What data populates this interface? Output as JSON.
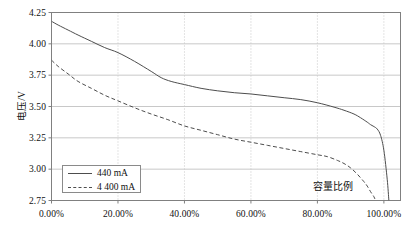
{
  "chart_data": {
    "type": "line",
    "title": "",
    "xlabel": "容量比例",
    "ylabel": "电压/V",
    "xlim": [
      0,
      105
    ],
    "ylim": [
      2.75,
      4.25
    ],
    "grid": true,
    "legend_position": "bottom-left",
    "x_tick_labels": [
      "0.00%",
      "20.00%",
      "40.00%",
      "60.00%",
      "80.00%",
      "100.00%"
    ],
    "x_tick_values": [
      0,
      20,
      40,
      60,
      80,
      100
    ],
    "y_tick_labels": [
      "2.75",
      "3.00",
      "3.25",
      "3.50",
      "3.75",
      "4.00",
      "4.25"
    ],
    "y_tick_values": [
      2.75,
      3.0,
      3.25,
      3.5,
      3.75,
      4.0,
      4.25
    ],
    "series": [
      {
        "name": "440 mA",
        "style": "solid",
        "color": "#4d4d4d",
        "x": [
          0,
          2,
          5,
          8,
          12,
          16,
          20,
          25,
          30,
          33,
          36,
          40,
          45,
          50,
          55,
          60,
          65,
          70,
          75,
          80,
          85,
          88,
          91,
          93,
          95,
          96,
          97,
          98,
          99,
          100,
          101,
          101.5
        ],
        "y": [
          4.18,
          4.15,
          4.11,
          4.07,
          4.02,
          3.97,
          3.93,
          3.86,
          3.78,
          3.73,
          3.7,
          3.675,
          3.645,
          3.625,
          3.61,
          3.6,
          3.585,
          3.57,
          3.555,
          3.53,
          3.495,
          3.47,
          3.44,
          3.41,
          3.375,
          3.355,
          3.34,
          3.32,
          3.27,
          3.15,
          2.92,
          2.75
        ]
      },
      {
        "name": "4 400 mA",
        "style": "dashed",
        "color": "#4d4d4d",
        "x": [
          0,
          2,
          5,
          8,
          12,
          16,
          20,
          25,
          30,
          35,
          40,
          45,
          50,
          55,
          60,
          65,
          70,
          75,
          80,
          83,
          86,
          88,
          90,
          92,
          94,
          95,
          96,
          97,
          97.5
        ],
        "y": [
          3.87,
          3.82,
          3.76,
          3.7,
          3.645,
          3.59,
          3.545,
          3.49,
          3.44,
          3.395,
          3.345,
          3.31,
          3.275,
          3.24,
          3.215,
          3.19,
          3.165,
          3.14,
          3.115,
          3.1,
          3.07,
          3.045,
          3.01,
          2.96,
          2.9,
          2.865,
          2.82,
          2.78,
          2.75
        ]
      }
    ],
    "colors": {
      "axis": "#808080",
      "grid": "#c8c8c8",
      "line": "#4d4d4d",
      "text": "#111111",
      "background": "#ffffff"
    }
  },
  "legend": {
    "entries": [
      {
        "label": "440 mA",
        "style": "solid"
      },
      {
        "label": "4 400 mA",
        "style": "dashed"
      }
    ]
  }
}
